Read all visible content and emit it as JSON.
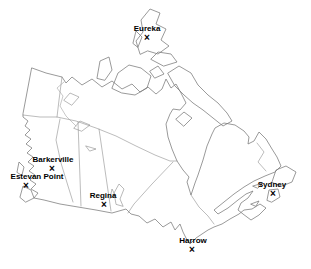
{
  "window": {
    "background_color": "#ffffff"
  },
  "map": {
    "outline_color": "#787878",
    "border_color": "#8e8e8e",
    "label_color": "#000000",
    "marker_glyph": "×",
    "width_px": 311,
    "height_px": 269
  },
  "stations": [
    {
      "name": "Eureka",
      "label_x": 147,
      "label_y": 29,
      "marker_x": 147,
      "marker_y": 38
    },
    {
      "name": "Barkerville",
      "label_x": 53,
      "label_y": 160,
      "marker_x": 52,
      "marker_y": 169
    },
    {
      "name": "Estevan Point",
      "label_x": 37,
      "label_y": 177,
      "marker_x": 26,
      "marker_y": 186
    },
    {
      "name": "Regina",
      "label_x": 103,
      "label_y": 196,
      "marker_x": 104,
      "marker_y": 205
    },
    {
      "name": "Sydney",
      "label_x": 272,
      "label_y": 185,
      "marker_x": 273,
      "marker_y": 194
    },
    {
      "name": "Harrow",
      "label_x": 193,
      "label_y": 241,
      "marker_x": 192,
      "marker_y": 250
    }
  ]
}
